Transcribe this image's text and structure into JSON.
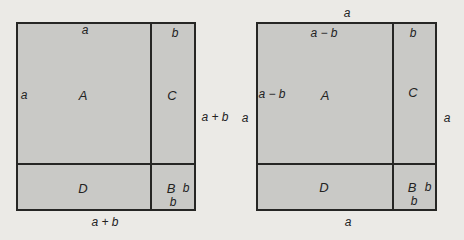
{
  "diagram": {
    "colors": {
      "background": "#ebeae6",
      "square_fill": "#c9c9c6",
      "line": "#262624"
    },
    "left_figure": {
      "labels": {
        "top_inner": "a",
        "top_right_inner": "b",
        "left_inner": "a",
        "region_a": "A",
        "region_c": "C",
        "region_d": "D",
        "region_b": "B",
        "b_right_of_b": "b",
        "b_below_b": "b",
        "right_outer": "a + b",
        "bottom_outer": "a + b"
      }
    },
    "right_figure": {
      "labels": {
        "top_outer": "a",
        "top_inner": "a − b",
        "top_right_inner": "b",
        "left_inner": "a − b",
        "left_outer": "a",
        "region_a": "A",
        "region_c": "C",
        "right_outer": "a",
        "region_d": "D",
        "region_b": "B",
        "b_right_of_b": "b",
        "b_below_b": "b",
        "bottom_outer": "a"
      }
    }
  }
}
